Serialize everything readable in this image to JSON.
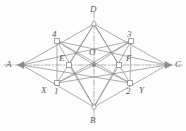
{
  "figure": {
    "background_color": "#fefefe",
    "line_color": "#8a8a8a",
    "axis_color": "#a0a0a0",
    "label_color": "#5b5b5b",
    "width": 186,
    "height": 131,
    "points": [
      {
        "id": "A",
        "label": "A",
        "x": 22,
        "y": 65,
        "label_x": 6,
        "label_y": 60,
        "marker": "arrow-left"
      },
      {
        "id": "D",
        "label": "D",
        "x": 94,
        "y": 24,
        "label_x": 90,
        "label_y": 5,
        "marker": "vertex"
      },
      {
        "id": "C",
        "label": "C",
        "x": 167,
        "y": 65,
        "label_x": 175,
        "label_y": 60,
        "marker": "arrow-right"
      },
      {
        "id": "B",
        "label": "B",
        "x": 94,
        "y": 107,
        "label_x": 90,
        "label_y": 116,
        "marker": "vertex"
      },
      {
        "id": "P4",
        "label": "4",
        "x": 57,
        "y": 41,
        "label_x": 52,
        "label_y": 30,
        "marker": "square"
      },
      {
        "id": "P3",
        "label": "3",
        "x": 131,
        "y": 41,
        "label_x": 127,
        "label_y": 30,
        "marker": "square"
      },
      {
        "id": "P1",
        "label": "1",
        "x": 57,
        "y": 83,
        "label_x": 54,
        "label_y": 87,
        "marker": "square"
      },
      {
        "id": "P2",
        "label": "2",
        "x": 130,
        "y": 83,
        "label_x": 126,
        "label_y": 87,
        "marker": "square"
      },
      {
        "id": "E",
        "label": "E",
        "x": 69,
        "y": 65,
        "label_x": 59,
        "label_y": 54,
        "marker": "square"
      },
      {
        "id": "F",
        "label": "F",
        "x": 119,
        "y": 65,
        "label_x": 126,
        "label_y": 54,
        "marker": "square"
      },
      {
        "id": "O",
        "label": "O",
        "x": 94,
        "y": 65,
        "label_x": 89,
        "label_y": 48,
        "marker": "dot"
      },
      {
        "id": "X",
        "label": "X",
        "x": 45,
        "y": 86,
        "label_x": 41,
        "label_y": 86,
        "marker": "none"
      },
      {
        "id": "Y",
        "label": "Y",
        "x": 142,
        "y": 86,
        "label_x": 139,
        "label_y": 86,
        "marker": "none"
      }
    ],
    "edges": [
      {
        "from": "A",
        "to": "D",
        "style": "solid"
      },
      {
        "from": "D",
        "to": "C",
        "style": "solid"
      },
      {
        "from": "C",
        "to": "B",
        "style": "solid"
      },
      {
        "from": "B",
        "to": "A",
        "style": "solid"
      },
      {
        "from": "A",
        "to": "C",
        "style": "dashdot"
      },
      {
        "from": "D",
        "to": "B",
        "style": "dashdot"
      },
      {
        "from": "D",
        "to": "P1",
        "style": "solid"
      },
      {
        "from": "D",
        "to": "P2",
        "style": "solid"
      },
      {
        "from": "D",
        "to": "E",
        "style": "solid"
      },
      {
        "from": "D",
        "to": "F",
        "style": "solid"
      },
      {
        "from": "B",
        "to": "P4",
        "style": "solid"
      },
      {
        "from": "B",
        "to": "P3",
        "style": "solid"
      },
      {
        "from": "B",
        "to": "E",
        "style": "solid"
      },
      {
        "from": "B",
        "to": "F",
        "style": "solid"
      },
      {
        "from": "A",
        "to": "P3",
        "style": "solid"
      },
      {
        "from": "A",
        "to": "P2",
        "style": "solid"
      },
      {
        "from": "C",
        "to": "P4",
        "style": "solid"
      },
      {
        "from": "C",
        "to": "P1",
        "style": "solid"
      },
      {
        "from": "P4",
        "to": "P2",
        "style": "solid"
      },
      {
        "from": "P1",
        "to": "P3",
        "style": "solid"
      },
      {
        "from": "P4",
        "to": "P1",
        "style": "solid"
      },
      {
        "from": "P3",
        "to": "P2",
        "style": "solid"
      },
      {
        "from": "P4",
        "to": "O",
        "style": "solid"
      },
      {
        "from": "P3",
        "to": "O",
        "style": "solid"
      },
      {
        "from": "P1",
        "to": "O",
        "style": "solid"
      },
      {
        "from": "P2",
        "to": "O",
        "style": "solid"
      }
    ]
  }
}
